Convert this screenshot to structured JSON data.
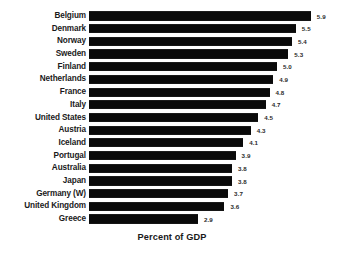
{
  "chart_data": {
    "type": "bar",
    "orientation": "horizontal",
    "title": "",
    "subtitle": "",
    "xlabel": "Percent of GDP",
    "ylabel": "",
    "grid": false,
    "legend": null,
    "xlim": [
      0,
      5.9
    ],
    "value_label_format": "one-decimal",
    "sort": "descending",
    "categories": [
      "Belgium",
      "Denmark",
      "Norway",
      "Sweden",
      "Finland",
      "Netherlands",
      "France",
      "Italy",
      "United States",
      "Austria",
      "Iceland",
      "Portugal",
      "Australia",
      "Japan",
      "Germany (W)",
      "United Kingdom",
      "Greece"
    ],
    "values": [
      5.9,
      5.5,
      5.4,
      5.3,
      5.0,
      4.9,
      4.8,
      4.7,
      4.5,
      4.3,
      4.1,
      3.9,
      3.8,
      3.8,
      3.7,
      3.6,
      2.9
    ],
    "value_labels": [
      "5.9",
      "5.5",
      "5.4",
      "5.3",
      "5.0",
      "4.9",
      "4.8",
      "4.7",
      "4.5",
      "4.3",
      "4.1",
      "3.9",
      "3.8",
      "3.8",
      "3.7",
      "3.6",
      "2.9"
    ],
    "bar_color": "#0a0a0a",
    "background_color": "#ffffff",
    "text_color": "#1a1a1a"
  },
  "axis": {
    "x_title": "Percent of GDP"
  }
}
